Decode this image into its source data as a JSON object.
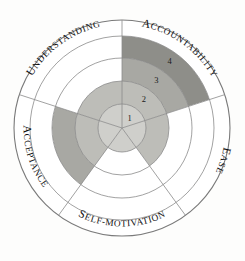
{
  "diagram": {
    "type": "radial-sector-wheel",
    "title_visible": false,
    "center": {
      "x": 122,
      "y": 128
    },
    "outer_radius": 108,
    "ring_radii": [
      24,
      47,
      70,
      92,
      108
    ],
    "sector_count": 5,
    "sector_span_degrees": 72,
    "colors": {
      "background": "#fdfdfc",
      "outline": "#7a7a7a",
      "ring_line": "#8a8a8a",
      "text": "#111111",
      "empty": "#ffffff",
      "level1": "#cfcfcb",
      "level2": "#bdbdb8",
      "level3": "#a8a8a3",
      "level4": "#8e8e89",
      "dark_fill": "#7d7d78",
      "darker_fill": "#6e6e69"
    },
    "level_labels": [
      {
        "id": "level-1",
        "text": "1",
        "ring": 1
      },
      {
        "id": "level-2",
        "text": "2",
        "ring": 2
      },
      {
        "id": "level-3",
        "text": "3",
        "ring": 3
      },
      {
        "id": "level-4",
        "text": "4",
        "ring": 4
      }
    ],
    "sectors": [
      {
        "id": "accountability",
        "label": "Accountability",
        "lead_letter": "A",
        "rest_letters": "CCOUNTABILITY",
        "start_angle": -90,
        "end_angle": -18,
        "filled_level": 4,
        "label_orientation": "clockwise-outside"
      },
      {
        "id": "ease",
        "label": "Ease",
        "lead_letter": "E",
        "rest_letters": "ASE",
        "start_angle": -18,
        "end_angle": 54,
        "filled_level": 2,
        "label_orientation": "clockwise-outside"
      },
      {
        "id": "self-motivation",
        "label": "Self-Motivation",
        "lead_letter": "S",
        "rest_letters": "ELF-MOTIVATION",
        "start_angle": 54,
        "end_angle": 126,
        "filled_level": 1,
        "label_orientation": "clockwise-outside-inverted"
      },
      {
        "id": "acceptance",
        "label": "Acceptance",
        "lead_letter": "A",
        "rest_letters": "CCEPTANCE",
        "start_angle": 126,
        "end_angle": 198,
        "filled_level": 3,
        "label_orientation": "clockwise-outside-inverted"
      },
      {
        "id": "understanding",
        "label": "Understanding",
        "lead_letter": "U",
        "rest_letters": "NDERSTANDING",
        "start_angle": 198,
        "end_angle": 270,
        "filled_level": 2,
        "label_orientation": "clockwise-outside"
      }
    ]
  },
  "chart_data": {
    "type": "radar-sector",
    "title": "",
    "categories": [
      "Accountability",
      "Ease",
      "Self-Motivation",
      "Acceptance",
      "Understanding"
    ],
    "values": [
      4,
      2,
      1,
      3,
      2
    ],
    "scale_labels": [
      "1",
      "2",
      "3",
      "4"
    ],
    "ylim": [
      0,
      4
    ],
    "grid": true,
    "legend": "none",
    "xlabel": "",
    "ylabel": ""
  }
}
